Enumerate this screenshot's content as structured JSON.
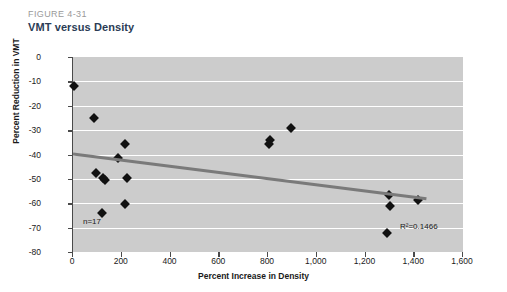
{
  "header": {
    "figure_number": "FIGURE 4-31",
    "title": "VMT versus Density",
    "number_color": "#9a9a9a",
    "title_color": "#2b3c55"
  },
  "chart_data": {
    "type": "scatter",
    "title": "VMT versus Density",
    "xlabel": "Percent Increase in Density",
    "ylabel": "Percent Reduction in VMT",
    "xlim": [
      0,
      1600
    ],
    "ylim": [
      -80,
      0
    ],
    "xticks": [
      0,
      200,
      400,
      600,
      800,
      1000,
      1200,
      1400,
      1600
    ],
    "xticklabels": [
      "0",
      "200",
      "400",
      "600",
      "800",
      "1,000",
      "1,200",
      "1,400",
      "1,600"
    ],
    "yticks": [
      0,
      -10,
      -20,
      -30,
      -40,
      -50,
      -60,
      -70,
      -80
    ],
    "yticklabels": [
      "0",
      "-10",
      "-20",
      "-30",
      "-40",
      "-50",
      "-60",
      "-70",
      "-80"
    ],
    "grid": "horizontal-white",
    "plot_background": "#cccccc",
    "marker": "diamond",
    "marker_color": "#111111",
    "points": [
      {
        "x": 5,
        "y": -12
      },
      {
        "x": 85,
        "y": -25
      },
      {
        "x": 215,
        "y": -35.5
      },
      {
        "x": 185,
        "y": -41.5
      },
      {
        "x": 95,
        "y": -47.5
      },
      {
        "x": 125,
        "y": -49.5
      },
      {
        "x": 130,
        "y": -50.5
      },
      {
        "x": 220,
        "y": -49.5
      },
      {
        "x": 215,
        "y": -60.5
      },
      {
        "x": 120,
        "y": -64
      },
      {
        "x": 810,
        "y": -34
      },
      {
        "x": 805,
        "y": -35.5
      },
      {
        "x": 895,
        "y": -29
      },
      {
        "x": 1295,
        "y": -56.5
      },
      {
        "x": 1300,
        "y": -61
      },
      {
        "x": 1415,
        "y": -58.5
      },
      {
        "x": 1290,
        "y": -72
      }
    ],
    "trendline": {
      "color": "#7a7a7a",
      "width": 3,
      "x0": 0,
      "y0": -39.8,
      "x1": 1450,
      "y1": -58.2
    },
    "annotations": [
      {
        "name": "sample-size",
        "text": "n=17"
      },
      {
        "name": "r-squared",
        "text": "R²=0.1466"
      }
    ],
    "n": 17,
    "r_squared": 0.1466
  },
  "annotations": {
    "n_label": "n=17",
    "r2_label": "R²=0.1466"
  }
}
